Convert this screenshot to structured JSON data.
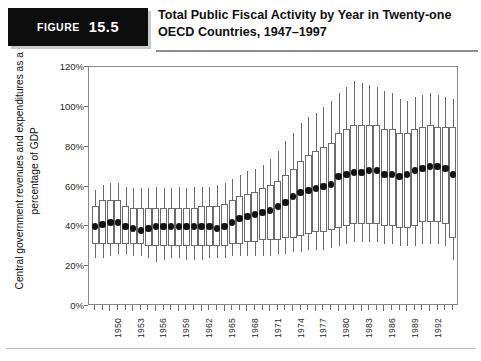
{
  "figure": {
    "badge_label": "Figure",
    "badge_number": "15.5",
    "title": "Total Public Fiscal Activity by Year in Twenty-one OECD Countries, 1947–1997"
  },
  "chart_data": {
    "type": "box",
    "title": "Total Public Fiscal Activity by Year in Twenty-one OECD Countries, 1947–1997",
    "xlabel": "",
    "ylabel": "Central government revenues and expenditures as a percentage of GDP",
    "ylim": [
      0,
      120
    ],
    "ytick_labels": [
      "0%",
      "20%",
      "40%",
      "60%",
      "80%",
      "100%",
      "120%"
    ],
    "ytick_values": [
      0,
      20,
      40,
      60,
      80,
      100,
      120
    ],
    "xlim": [
      1948,
      1995
    ],
    "xtick_values": [
      1950,
      1953,
      1956,
      1959,
      1962,
      1965,
      1968,
      1971,
      1974,
      1977,
      1980,
      1983,
      1986,
      1989,
      1992
    ],
    "xtick_labels": [
      "1950",
      "1953",
      "1956",
      "1959",
      "1962",
      "1965",
      "1968",
      "1971",
      "1974",
      "1977",
      "1980",
      "1983",
      "1986",
      "1989",
      "1992"
    ],
    "grid": false,
    "legend": null,
    "series_name": "Central government revenues and expenditures (% of GDP)",
    "median_color": "#141414",
    "box_color": "#6b6b6b",
    "years": [
      1948,
      1949,
      1950,
      1951,
      1952,
      1953,
      1954,
      1955,
      1956,
      1957,
      1958,
      1959,
      1960,
      1961,
      1962,
      1963,
      1964,
      1965,
      1966,
      1967,
      1968,
      1969,
      1970,
      1971,
      1972,
      1973,
      1974,
      1975,
      1976,
      1977,
      1978,
      1979,
      1980,
      1981,
      1982,
      1983,
      1984,
      1985,
      1986,
      1987,
      1988,
      1989,
      1990,
      1991,
      1992,
      1993,
      1994,
      1995
    ],
    "boxes": [
      {
        "year": 1948,
        "min": 24,
        "q1": 31,
        "median": 40,
        "q3": 50,
        "max": 58
      },
      {
        "year": 1949,
        "min": 24,
        "q1": 31,
        "median": 41,
        "q3": 53,
        "max": 61
      },
      {
        "year": 1950,
        "min": 25,
        "q1": 31,
        "median": 42,
        "q3": 53,
        "max": 62
      },
      {
        "year": 1951,
        "min": 26,
        "q1": 31,
        "median": 42,
        "q3": 53,
        "max": 62
      },
      {
        "year": 1952,
        "min": 26,
        "q1": 31,
        "median": 40,
        "q3": 50,
        "max": 60
      },
      {
        "year": 1953,
        "min": 25,
        "q1": 31,
        "median": 39,
        "q3": 49,
        "max": 59
      },
      {
        "year": 1954,
        "min": 25,
        "q1": 31,
        "median": 38,
        "q3": 49,
        "max": 59
      },
      {
        "year": 1955,
        "min": 24,
        "q1": 30,
        "median": 39,
        "q3": 49,
        "max": 59
      },
      {
        "year": 1956,
        "min": 22,
        "q1": 30,
        "median": 40,
        "q3": 49,
        "max": 60
      },
      {
        "year": 1957,
        "min": 23,
        "q1": 30,
        "median": 40,
        "q3": 49,
        "max": 59
      },
      {
        "year": 1958,
        "min": 24,
        "q1": 30,
        "median": 40,
        "q3": 49,
        "max": 59
      },
      {
        "year": 1959,
        "min": 24,
        "q1": 30,
        "median": 40,
        "q3": 49,
        "max": 60
      },
      {
        "year": 1960,
        "min": 23,
        "q1": 30,
        "median": 40,
        "q3": 49,
        "max": 59
      },
      {
        "year": 1961,
        "min": 23,
        "q1": 30,
        "median": 40,
        "q3": 49,
        "max": 60
      },
      {
        "year": 1962,
        "min": 23,
        "q1": 30,
        "median": 40,
        "q3": 50,
        "max": 60
      },
      {
        "year": 1963,
        "min": 24,
        "q1": 30,
        "median": 40,
        "q3": 50,
        "max": 60
      },
      {
        "year": 1964,
        "min": 24,
        "q1": 30,
        "median": 39,
        "q3": 50,
        "max": 61
      },
      {
        "year": 1965,
        "min": 24,
        "q1": 30,
        "median": 40,
        "q3": 51,
        "max": 62
      },
      {
        "year": 1966,
        "min": 25,
        "q1": 31,
        "median": 42,
        "q3": 53,
        "max": 64
      },
      {
        "year": 1967,
        "min": 25,
        "q1": 31,
        "median": 44,
        "q3": 55,
        "max": 66
      },
      {
        "year": 1968,
        "min": 25,
        "q1": 32,
        "median": 45,
        "q3": 56,
        "max": 68
      },
      {
        "year": 1969,
        "min": 25,
        "q1": 32,
        "median": 46,
        "q3": 57,
        "max": 69
      },
      {
        "year": 1970,
        "min": 25,
        "q1": 33,
        "median": 47,
        "q3": 59,
        "max": 71
      },
      {
        "year": 1971,
        "min": 25,
        "q1": 33,
        "median": 48,
        "q3": 61,
        "max": 74
      },
      {
        "year": 1972,
        "min": 26,
        "q1": 33,
        "median": 50,
        "q3": 63,
        "max": 78
      },
      {
        "year": 1973,
        "min": 26,
        "q1": 34,
        "median": 52,
        "q3": 66,
        "max": 83
      },
      {
        "year": 1974,
        "min": 27,
        "q1": 34,
        "median": 55,
        "q3": 69,
        "max": 87
      },
      {
        "year": 1975,
        "min": 27,
        "q1": 35,
        "median": 57,
        "q3": 73,
        "max": 92
      },
      {
        "year": 1976,
        "min": 28,
        "q1": 36,
        "median": 58,
        "q3": 76,
        "max": 95
      },
      {
        "year": 1977,
        "min": 28,
        "q1": 37,
        "median": 59,
        "q3": 78,
        "max": 97
      },
      {
        "year": 1978,
        "min": 28,
        "q1": 37,
        "median": 60,
        "q3": 80,
        "max": 100
      },
      {
        "year": 1979,
        "min": 29,
        "q1": 38,
        "median": 61,
        "q3": 82,
        "max": 103
      },
      {
        "year": 1980,
        "min": 30,
        "q1": 39,
        "median": 65,
        "q3": 87,
        "max": 107
      },
      {
        "year": 1981,
        "min": 31,
        "q1": 40,
        "median": 66,
        "q3": 89,
        "max": 110
      },
      {
        "year": 1982,
        "min": 32,
        "q1": 41,
        "median": 67,
        "q3": 91,
        "max": 113
      },
      {
        "year": 1983,
        "min": 32,
        "q1": 41,
        "median": 67,
        "q3": 91,
        "max": 112
      },
      {
        "year": 1984,
        "min": 32,
        "q1": 41,
        "median": 68,
        "q3": 91,
        "max": 111
      },
      {
        "year": 1985,
        "min": 32,
        "q1": 41,
        "median": 68,
        "q3": 91,
        "max": 110
      },
      {
        "year": 1986,
        "min": 31,
        "q1": 40,
        "median": 66,
        "q3": 89,
        "max": 108
      },
      {
        "year": 1987,
        "min": 31,
        "q1": 40,
        "median": 66,
        "q3": 89,
        "max": 107
      },
      {
        "year": 1988,
        "min": 30,
        "q1": 39,
        "median": 65,
        "q3": 87,
        "max": 104
      },
      {
        "year": 1989,
        "min": 30,
        "q1": 39,
        "median": 66,
        "q3": 87,
        "max": 103
      },
      {
        "year": 1990,
        "min": 30,
        "q1": 40,
        "median": 68,
        "q3": 89,
        "max": 105
      },
      {
        "year": 1991,
        "min": 31,
        "q1": 42,
        "median": 69,
        "q3": 90,
        "max": 106
      },
      {
        "year": 1992,
        "min": 31,
        "q1": 42,
        "median": 70,
        "q3": 91,
        "max": 107
      },
      {
        "year": 1993,
        "min": 31,
        "q1": 42,
        "median": 70,
        "q3": 90,
        "max": 106
      },
      {
        "year": 1994,
        "min": 30,
        "q1": 41,
        "median": 69,
        "q3": 90,
        "max": 105
      },
      {
        "year": 1995,
        "min": 23,
        "q1": 34,
        "median": 66,
        "q3": 90,
        "max": 104
      }
    ]
  }
}
